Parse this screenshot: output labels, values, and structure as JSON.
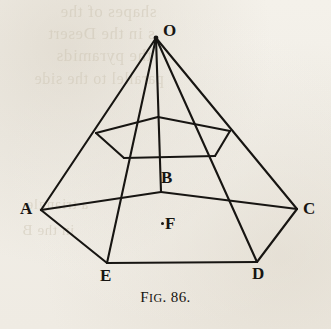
{
  "figure": {
    "caption_prefix": "F",
    "caption_prefix_rest": "IG",
    "caption_number": ". 86.",
    "caption_full": "FIG. 86.",
    "ink_color": "#171512",
    "paper_color": "#f2efe9",
    "ghost_color": "#cfc7b6"
  },
  "labels": [
    {
      "id": "O",
      "text": "O",
      "x": 163,
      "y": 22,
      "role": "apex-vertex"
    },
    {
      "id": "A",
      "text": "A",
      "x": 20,
      "y": 200,
      "role": "base-vertex"
    },
    {
      "id": "B",
      "text": "B",
      "x": 161,
      "y": 169,
      "role": "interior-vertex"
    },
    {
      "id": "C",
      "text": "C",
      "x": 303,
      "y": 200,
      "role": "base-vertex"
    },
    {
      "id": "D",
      "text": "D",
      "x": 252,
      "y": 265,
      "role": "base-vertex"
    },
    {
      "id": "E",
      "text": "E",
      "x": 100,
      "y": 267,
      "role": "base-vertex"
    },
    {
      "id": "F",
      "text": "F",
      "x": 165,
      "y": 215,
      "role": "center-point"
    }
  ],
  "points": [
    {
      "id": "F-dot",
      "x": 161,
      "y": 222,
      "role": "center-marker-dot"
    }
  ],
  "geometry": {
    "apex": {
      "id": "O",
      "x": 156,
      "y": 38
    },
    "base_pentagon": [
      {
        "id": "A",
        "x": 41,
        "y": 210
      },
      {
        "id": "B",
        "x": 161,
        "y": 192
      },
      {
        "id": "C",
        "x": 297,
        "y": 209
      },
      {
        "id": "D",
        "x": 257,
        "y": 262
      },
      {
        "id": "E",
        "x": 107,
        "y": 263
      }
    ],
    "inner_pentagon": [
      {
        "id": "a",
        "x": 96,
        "y": 133
      },
      {
        "id": "b",
        "x": 158,
        "y": 117
      },
      {
        "id": "c",
        "x": 230,
        "y": 131
      },
      {
        "id": "d",
        "x": 215,
        "y": 156
      },
      {
        "id": "e",
        "x": 124,
        "y": 158
      }
    ],
    "lateral_edges": [
      {
        "from": "O",
        "to": "A"
      },
      {
        "from": "O",
        "to": "B"
      },
      {
        "from": "O",
        "to": "C"
      },
      {
        "from": "O",
        "to": "D"
      },
      {
        "from": "O",
        "to": "E"
      }
    ]
  },
  "ghost_lines": [
    {
      "text": "shapes of the",
      "x": 60,
      "y": 2,
      "size": 17
    },
    {
      "text": "s in the Desert",
      "x": 48,
      "y": 24,
      "size": 17
    },
    {
      "text": "the pyramids",
      "x": 56,
      "y": 46,
      "size": 17
    },
    {
      "text": "parallel to the side",
      "x": 34,
      "y": 70,
      "size": 16
    },
    {
      "text": "a triangle",
      "x": 26,
      "y": 196,
      "size": 15
    },
    {
      "text": "in the B",
      "x": 22,
      "y": 222,
      "size": 15
    }
  ]
}
